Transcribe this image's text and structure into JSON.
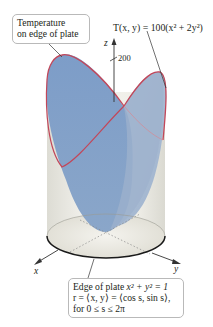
{
  "figure": {
    "callouts": {
      "top_left": {
        "line1": "Temperature",
        "line2": "on edge of plate"
      },
      "bottom": {
        "line1_text": "Edge of plate ",
        "line1_math": "x² + y² = 1",
        "line2": "r = ⟨x, y⟩ = ⟨cos s, sin s⟩,",
        "line3": "for 0 ≤ s ≤ 2π"
      }
    },
    "function_label": "T(x, y) = 100(x² + 2y²)",
    "axes": {
      "z": "z",
      "x": "x",
      "y": "y"
    },
    "z_tick": "200",
    "colors": {
      "surface_front": "#7c9cc6",
      "surface_back": "#a9bdd6",
      "edge_curve": "#c2475a",
      "cylinder": "#e8e6de",
      "plate_edge": "#1a1a1a",
      "callout_border": "#b9b9b9"
    }
  }
}
